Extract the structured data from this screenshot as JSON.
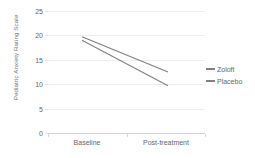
{
  "chart_data": {
    "type": "line",
    "title": "",
    "xlabel": "",
    "ylabel": "Pediatric Anxiety Rating Scale",
    "categories": [
      "Baseline",
      "Post-treatment"
    ],
    "x": [
      0,
      1
    ],
    "ylim": [
      0,
      25
    ],
    "yticks": [
      0,
      5,
      10,
      15,
      20,
      25
    ],
    "ytick_labels": [
      "0",
      "5",
      "10",
      "15",
      "20",
      "25"
    ],
    "grid": true,
    "legend_position": "right",
    "series": [
      {
        "name": "Zoloft",
        "values": [
          19.7,
          12.5
        ],
        "color": "#808080"
      },
      {
        "name": "Placebo",
        "values": [
          19.0,
          9.7
        ],
        "color": "#808080"
      }
    ]
  },
  "legend": {
    "entries": [
      {
        "label": "Zoloft"
      },
      {
        "label": "Placebo"
      }
    ]
  },
  "colors": {
    "series_line": "#808080",
    "gridline": "#ededed",
    "axis": "#d4d4d4",
    "tick_text": "#666666",
    "axis_title_text": "#6e6e6e",
    "background": "#ffffff"
  }
}
